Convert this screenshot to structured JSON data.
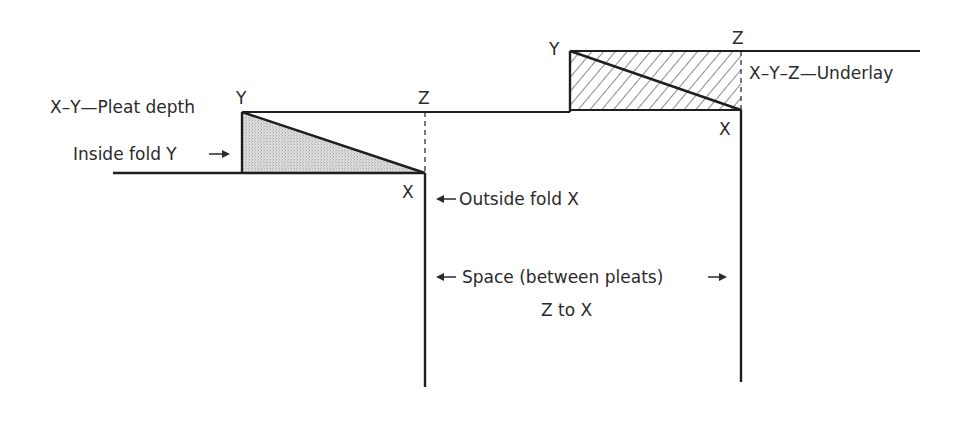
{
  "diagram": {
    "type": "pleat-construction-diagram",
    "colors": {
      "line": "#1e1e1e",
      "shade": "#d4d4d4",
      "text": "#2a2a2a",
      "background": "#ffffff"
    },
    "left_pleat": {
      "points": {
        "Y": "Y",
        "Z": "Z",
        "X": "X"
      },
      "labels": {
        "pleat_depth": "X–Y—Pleat depth",
        "inside_fold": "Inside fold Y",
        "outside_fold": "Outside fold X"
      }
    },
    "right_pleat": {
      "points": {
        "Y": "Y",
        "Z": "Z",
        "X": "X"
      },
      "labels": {
        "underlay": "X–Y–Z—Underlay"
      }
    },
    "space": {
      "label_line1": "Space (between pleats)",
      "label_line2": "Z to X"
    }
  }
}
